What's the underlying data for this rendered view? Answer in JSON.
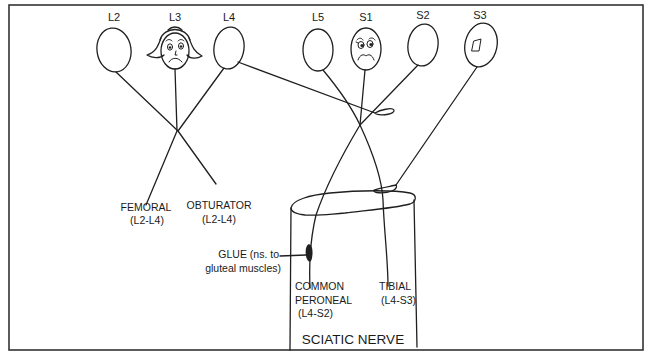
{
  "diagram": {
    "type": "illustration",
    "roots": [
      {
        "label": "L2",
        "face": "none"
      },
      {
        "label": "L3",
        "face": "worried-with-hair"
      },
      {
        "label": "L4",
        "face": "none"
      },
      {
        "label": "L5",
        "face": "none"
      },
      {
        "label": "S1",
        "face": "worried"
      },
      {
        "label": "S2",
        "face": "none"
      },
      {
        "label": "S3",
        "face": "small-patch"
      }
    ],
    "nerves": {
      "femoral": {
        "name": "FEMORAL",
        "roots": "(L2-L4)"
      },
      "obturator": {
        "name": "OBTURATOR",
        "roots": "(L2-L4)"
      },
      "glue": {
        "line1": "GLUE (ns. to",
        "line2": "gluteal muscles)"
      },
      "common_peroneal": {
        "line1": "COMMON",
        "line2": "PERONEAL",
        "roots": "(L4-S2)"
      },
      "tibial": {
        "name": "TIBIAL",
        "roots": "(L4-S3)"
      },
      "sciatic": {
        "name": "SCIATIC NERVE"
      }
    }
  }
}
